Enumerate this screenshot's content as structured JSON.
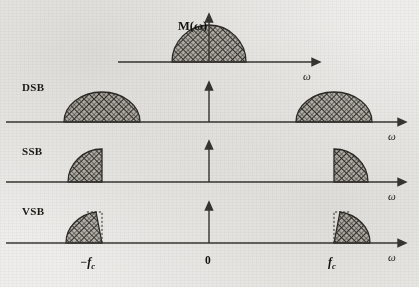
{
  "figure": {
    "title_symbol": "M(ω)",
    "axis_symbol": "ω",
    "zero_label": "0",
    "neg_fc_label": "−f",
    "neg_fc_sub": "c",
    "pos_fc_label": "f",
    "pos_fc_sub": "c",
    "background_color": "#efeeec",
    "line_color": "#3a3733",
    "fill_color": "#b9b6b0",
    "hatch_color": "#2e2b27"
  },
  "rows": [
    {
      "id": "baseband",
      "label": "",
      "baseline_y": 62,
      "axis_x_start": 118,
      "axis_x_end": 318,
      "omega_label": "ω",
      "omega_x": 303,
      "omega_y": 78,
      "vaxis": {
        "x": 209,
        "y_top": 16,
        "y_bottom": 62
      },
      "shapes": [
        {
          "type": "semicircle",
          "cx": 209,
          "half_width": 37,
          "height": 37
        }
      ]
    },
    {
      "id": "dsb",
      "label": "DSB",
      "label_x": 22,
      "label_y": 91,
      "baseline_y": 122,
      "axis_x_start": 6,
      "axis_x_end": 404,
      "omega_label": "ω",
      "omega_x": 388,
      "omega_y": 138,
      "vaxis": {
        "x": 209,
        "y_top": 82,
        "y_bottom": 122
      },
      "shapes": [
        {
          "type": "semicircle",
          "cx": 102,
          "half_width": 38,
          "height": 30
        },
        {
          "type": "semicircle",
          "cx": 334,
          "half_width": 38,
          "height": 30
        }
      ]
    },
    {
      "id": "ssb",
      "label": "SSB",
      "label_x": 22,
      "label_y": 155,
      "baseline_y": 182,
      "axis_x_start": 6,
      "axis_x_end": 404,
      "omega_label": "ω",
      "omega_x": 388,
      "omega_y": 198,
      "vaxis": {
        "x": 209,
        "y_top": 141,
        "y_bottom": 182
      },
      "shapes": [
        {
          "type": "quarter-left",
          "edge_x": 102,
          "width": 34,
          "height": 33
        },
        {
          "type": "quarter-right",
          "edge_x": 334,
          "width": 34,
          "height": 33
        }
      ]
    },
    {
      "id": "vsb",
      "label": "VSB",
      "label_x": 22,
      "label_y": 215,
      "baseline_y": 243,
      "axis_x_start": 6,
      "axis_x_end": 404,
      "omega_label": "ω",
      "omega_x": 388,
      "omega_y": 259,
      "vaxis": {
        "x": 209,
        "y_top": 202,
        "y_bottom": 243
      },
      "shapes": [
        {
          "type": "vestigial-left",
          "edge_x": 102,
          "width": 36,
          "height": 31
        },
        {
          "type": "vestigial-right",
          "edge_x": 334,
          "width": 36,
          "height": 31
        }
      ]
    }
  ],
  "tick_labels": [
    {
      "name": "neg-fc",
      "x": 92,
      "y": 263
    },
    {
      "name": "zero",
      "x": 209,
      "y": 261
    },
    {
      "name": "pos-fc",
      "x": 332,
      "y": 263
    }
  ]
}
